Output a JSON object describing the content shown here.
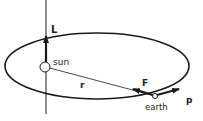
{
  "diagram": {
    "labels": {
      "angular_momentum": "L",
      "sun": "sun",
      "radius": "r",
      "force": "F",
      "earth": "earth",
      "momentum": "p"
    },
    "colors": {
      "stroke": "#1a1a1a",
      "background": "#ffffff"
    }
  }
}
